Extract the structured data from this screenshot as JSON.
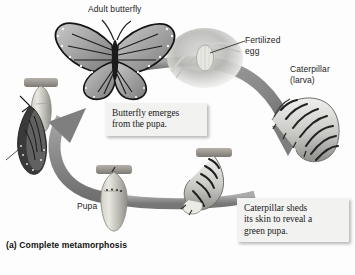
{
  "figure": {
    "caption": "(a) Complete metamorphosis",
    "background_color": "#fdfdfd",
    "arrow_color": "#8a8a8a"
  },
  "labels": {
    "adult_butterfly": "Adult butterfly",
    "fertilized_egg": "Fertilized\negg",
    "caterpillar": "Caterpillar\n(larva)",
    "pupa": "Pupa"
  },
  "callouts": {
    "emerges": "Butterfly emerges\nfrom the pupa.",
    "sheds": "Caterpillar sheds\nits skin to reveal a\ngreen pupa."
  },
  "stages": {
    "adult_butterfly": "adult-butterfly-photo",
    "fertilized_egg": "fertilized-egg-photo",
    "caterpillar_larva": "caterpillar-larva-photo",
    "shedding_caterpillar": "shedding-caterpillar-photo",
    "pupa_chrysalis": "pupa-chrysalis-photo",
    "emerging_butterfly": "emerging-butterfly-photo"
  }
}
